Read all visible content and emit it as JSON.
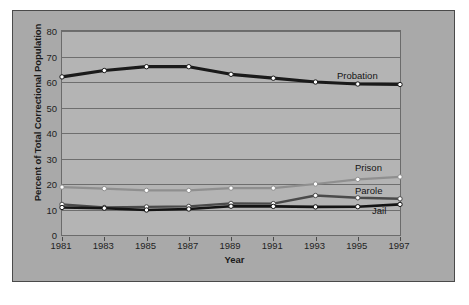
{
  "chart_data": {
    "type": "line",
    "title": "",
    "xlabel": "Year",
    "ylabel": "Percent of Total Correctional Population",
    "x": [
      1981,
      1983,
      1985,
      1987,
      1989,
      1991,
      1993,
      1995,
      1997
    ],
    "categories": [
      "1981",
      "1983",
      "1985",
      "1987",
      "1989",
      "1991",
      "1993",
      "1995",
      "1997"
    ],
    "xlim": [
      1981,
      1997
    ],
    "ylim": [
      0,
      80
    ],
    "yticks": [
      0,
      10,
      20,
      30,
      40,
      50,
      60,
      70,
      80
    ],
    "ytick_labels": [
      "0",
      "10",
      "20",
      "30",
      "40",
      "50",
      "60",
      "70",
      "80"
    ],
    "grid": true,
    "legend_position": "inline-right",
    "series": [
      {
        "name": "Probation",
        "values": [
          62,
          64.5,
          66,
          66,
          63,
          61.5,
          60,
          59.2,
          59
        ],
        "color": "#1a1a1a",
        "marker": "circle"
      },
      {
        "name": "Prison",
        "values": [
          18.8,
          18.2,
          17.5,
          17.5,
          18.4,
          18.4,
          20,
          21.8,
          22.8
        ],
        "color": "#8f8f8f",
        "marker": "circle"
      },
      {
        "name": "Parole",
        "values": [
          12,
          10.8,
          11,
          11.2,
          12.4,
          12.3,
          15.5,
          14.6,
          14.2
        ],
        "color": "#4a4a4a",
        "marker": "circle"
      },
      {
        "name": "Jail",
        "values": [
          10.8,
          10.5,
          9.8,
          10.2,
          11.3,
          11.2,
          11,
          11.1,
          12
        ],
        "color": "#141414",
        "marker": "circle"
      }
    ]
  },
  "colors": {
    "figure_background": "#a9a9a9",
    "plot_background": "#b4b4b4",
    "gridline": "#6e6e6e",
    "axis": "#4a4a4a",
    "text": "#1a1a1a"
  }
}
